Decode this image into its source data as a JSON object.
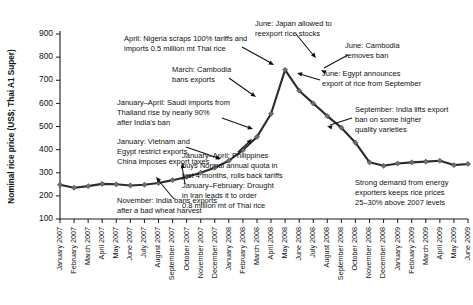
{
  "chart_data": {
    "type": "line",
    "title": "",
    "subtitle": "",
    "xlabel": "",
    "ylabel": "Nominal rice price (US$; Thai A1 Super)",
    "ylim": [
      100,
      900
    ],
    "yticks": [
      100,
      200,
      300,
      400,
      500,
      600,
      700,
      800,
      900
    ],
    "grid": false,
    "legend": "none",
    "categories": [
      "January 2007",
      "February 2007",
      "March 2007",
      "April 2007",
      "May 2007",
      "June 2007",
      "July 2007",
      "August 2007",
      "September 2007",
      "October 2007",
      "November 2007",
      "December 2007",
      "January 2008",
      "February 2008",
      "March 2008",
      "April 2008",
      "May 2008",
      "June 2008",
      "July 2008",
      "August 2008",
      "September 2008",
      "October 2008",
      "November 2008",
      "December 2008",
      "January 2009",
      "February 2009",
      "March 2009",
      "April 2009",
      "May 2009",
      "June 2009"
    ],
    "series": [
      {
        "name": "Nominal rice price (US$; Thai A1 Super)",
        "values": [
          248,
          235,
          242,
          252,
          250,
          245,
          248,
          256,
          268,
          282,
          300,
          322,
          352,
          398,
          455,
          555,
          745,
          655,
          600,
          545,
          495,
          430,
          345,
          330,
          340,
          345,
          348,
          352,
          333,
          338
        ]
      }
    ],
    "annotations": [
      {
        "id": "india-ban-nov-2007",
        "lines": [
          "November: India bans exports",
          "after a bad wheat harvest"
        ]
      },
      {
        "id": "vietnam-egypt-china-jan-2008",
        "lines": [
          "January: Vietnam and",
          "Egypt restrict exports.",
          "China imposes export taxes"
        ]
      },
      {
        "id": "saudi-imports-jan-apr-2008",
        "lines": [
          "January–April: Saudi imports from",
          "Thailand rise by nearly 90%",
          "after India's ban"
        ]
      },
      {
        "id": "cambodia-bans-mar-2008",
        "lines": [
          "March: Cambodia",
          "bans exports"
        ]
      },
      {
        "id": "nigeria-tariffs-apr-2008",
        "lines": [
          "April: Nigeria scraps 100% tariffs and",
          "imports 0.5 million mt Thai rice"
        ]
      },
      {
        "id": "iran-drought-jan-feb-2008",
        "lines": [
          "January–February: Drought",
          "in Iran leads it to order",
          "0.8 million mt of Thai rice"
        ]
      },
      {
        "id": "philippines-quota-jan-apr-2008",
        "lines": [
          "January–April: Philippines",
          "buys Normal annual quota in",
          "just 4 months, rolls back tariffs"
        ]
      },
      {
        "id": "japan-reexport-jun-2008",
        "lines": [
          "June: Japan allowed to",
          "reexport rice stocks"
        ]
      },
      {
        "id": "cambodia-removes-ban-jun-2008",
        "lines": [
          "June: Cambodia",
          "removes ban"
        ]
      },
      {
        "id": "egypt-export-jun-2008",
        "lines": [
          "June: Egypt announces",
          "export of rice from September"
        ]
      },
      {
        "id": "india-lifts-ban-sep-2008",
        "lines": [
          "September: India lifts export",
          "ban on some higher",
          "quality varieties"
        ]
      },
      {
        "id": "energy-exporters-demand",
        "lines": [
          "Strong demand from energy",
          "exporters keeps rice prices",
          "25–30% above 2007 levels"
        ]
      }
    ]
  },
  "colors": {
    "line": "#2b2b2b",
    "marker": "#6f6f6f",
    "axis": "#1a1a1a",
    "text": "#111111",
    "background": "#ffffff"
  }
}
